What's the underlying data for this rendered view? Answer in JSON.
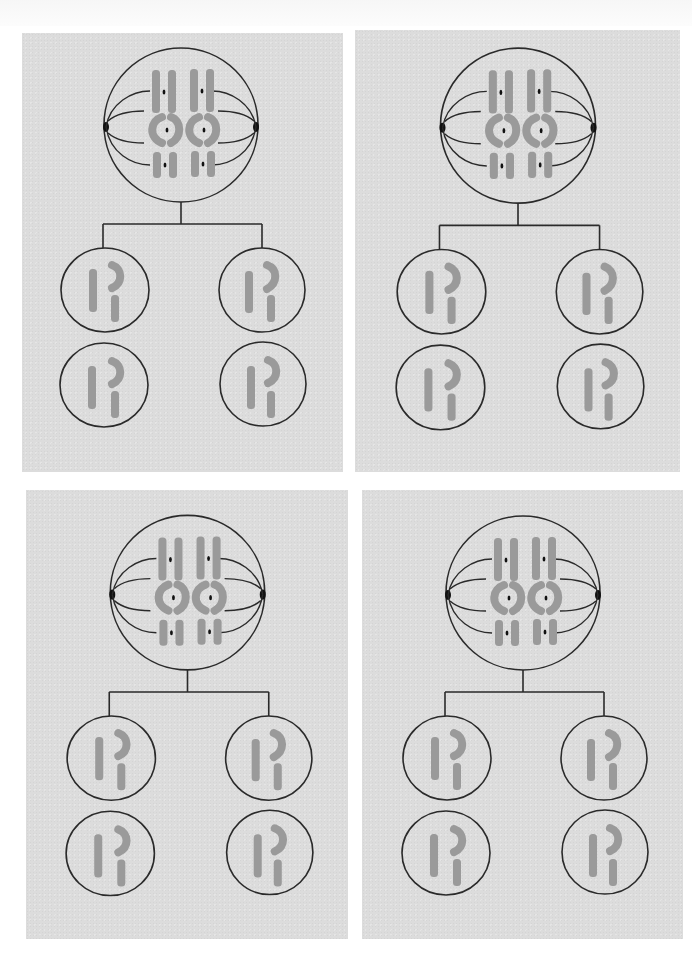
{
  "figure": {
    "colors": {
      "panel_background": "#dcdcdc",
      "page_background": "#ffffff",
      "outline": "#2a2a2a",
      "chromosome": "#9a9a9a",
      "centromere": "#111111"
    }
  },
  "panels": [
    {
      "id": "top-left",
      "stage": "metaphase-I",
      "daughter_cell_count": 4,
      "chromosome_pairs": 3
    },
    {
      "id": "top-right",
      "stage": "metaphase-I",
      "daughter_cell_count": 4,
      "chromosome_pairs": 3
    },
    {
      "id": "bottom-left",
      "stage": "metaphase-I",
      "daughter_cell_count": 4,
      "chromosome_pairs": 3
    },
    {
      "id": "bottom-right",
      "stage": "metaphase-I",
      "daughter_cell_count": 4,
      "chromosome_pairs": 3
    }
  ]
}
